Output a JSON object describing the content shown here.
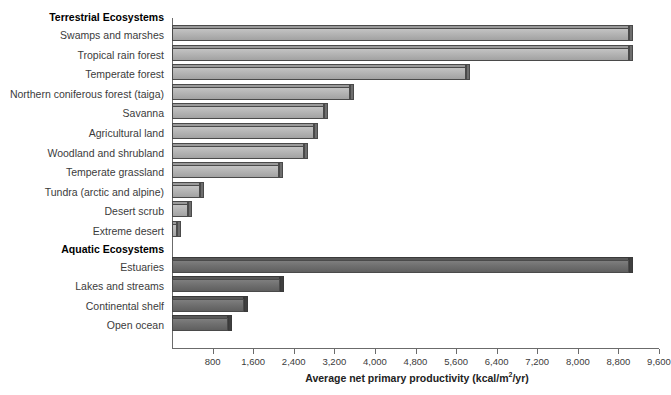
{
  "chart_data": {
    "type": "bar",
    "orientation": "horizontal",
    "title": "",
    "xlabel": "Average net primary productivity (kcal/m2/yr)",
    "xlabel_parts": {
      "before": "Average net primary productivity (kcal/m",
      "sup": "2",
      "after": "/yr)"
    },
    "ylabel": "",
    "xlim": [
      0,
      9600
    ],
    "xticks": [
      800,
      1600,
      2400,
      3200,
      4000,
      4800,
      5600,
      6400,
      7200,
      8000,
      8800,
      9600
    ],
    "xtick_labels": [
      "800",
      "1,600",
      "2,400",
      "3,200",
      "4,000",
      "4,800",
      "5,600",
      "6,400",
      "7,200",
      "8,000",
      "8,800",
      "9,600"
    ],
    "grid": false,
    "legend": "none",
    "groups": [
      {
        "name": "Terrestrial Ecosystems",
        "color": "#b4b4b4",
        "categories": [
          "Swamps and marshes",
          "Tropical rain forest",
          "Temperate forest",
          "Northern coniferous forest (taiga)",
          "Savanna",
          "Agricultural land",
          "Woodland and shrubland",
          "Temperate grassland",
          "Tundra (arctic and alpine)",
          "Desert scrub",
          "Extreme desert"
        ],
        "values": [
          9000,
          9000,
          5800,
          3500,
          3000,
          2800,
          2600,
          2100,
          560,
          320,
          100
        ]
      },
      {
        "name": "Aquatic Ecosystems",
        "color": "#6f6f6f",
        "categories": [
          "Estuaries",
          "Lakes and streams",
          "Continental shelf",
          "Open ocean"
        ],
        "values": [
          9000,
          2120,
          1420,
          1100
        ]
      }
    ]
  },
  "colors": {
    "terrestrial_bar": "#b4b4b4",
    "aquatic_bar": "#6f6f6f",
    "axis": "#6b6b6b",
    "label_text": "#3b3b3b",
    "header_text": "#000000",
    "background": "#ffffff"
  }
}
